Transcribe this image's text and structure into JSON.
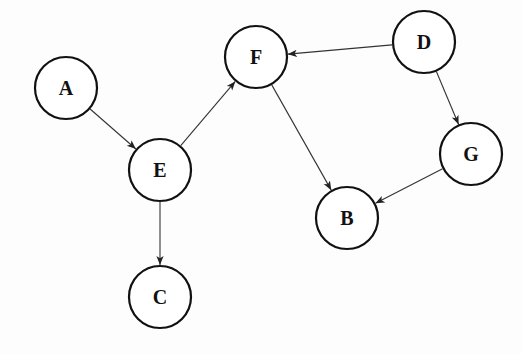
{
  "diagram": {
    "type": "directed-graph",
    "node_radius": 31,
    "nodes": [
      {
        "id": "A",
        "label": "A",
        "x": 66,
        "y": 88
      },
      {
        "id": "E",
        "label": "E",
        "x": 160,
        "y": 170
      },
      {
        "id": "F",
        "label": "F",
        "x": 256,
        "y": 57
      },
      {
        "id": "D",
        "label": "D",
        "x": 424,
        "y": 42
      },
      {
        "id": "G",
        "label": "G",
        "x": 471,
        "y": 154
      },
      {
        "id": "B",
        "label": "B",
        "x": 347,
        "y": 218
      },
      {
        "id": "C",
        "label": "C",
        "x": 160,
        "y": 297
      }
    ],
    "edges": [
      {
        "from": "A",
        "to": "E"
      },
      {
        "from": "E",
        "to": "F"
      },
      {
        "from": "E",
        "to": "C"
      },
      {
        "from": "F",
        "to": "B"
      },
      {
        "from": "D",
        "to": "F"
      },
      {
        "from": "D",
        "to": "G"
      },
      {
        "from": "G",
        "to": "B"
      }
    ],
    "colors": {
      "stroke": "#111111",
      "edge": "#333333",
      "background": "#fdfdfd"
    }
  }
}
